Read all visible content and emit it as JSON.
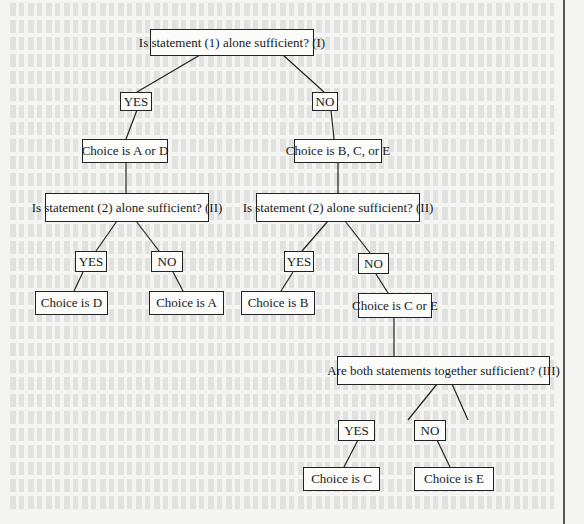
{
  "diagram": {
    "type": "decision-tree",
    "nodes": {
      "q1": "Is statement (1) alone sufficient? (I)",
      "q1_yes": "YES",
      "q1_no": "NO",
      "a_or_d": "Choice is A or D",
      "b_c_or_e": "Choice is B, C, or E",
      "q2_left": "Is statement (2) alone sufficient? (II)",
      "q2_right": "Is statement (2) alone sufficient? (II)",
      "q2_left_yes": "YES",
      "q2_left_no": "NO",
      "q2_right_yes": "YES",
      "q2_right_no": "NO",
      "choice_d": "Choice is D",
      "choice_a": "Choice is A",
      "choice_b": "Choice is B",
      "c_or_e": "Choice is C or E",
      "q3": "Are both statements together sufficient? (III)",
      "q3_yes": "YES",
      "q3_no": "NO",
      "choice_c": "Choice is C",
      "choice_e": "Choice is E"
    },
    "colors": {
      "line": "#222222",
      "background": "#f4f4f2",
      "box_fill": "#fbfbfa"
    }
  }
}
